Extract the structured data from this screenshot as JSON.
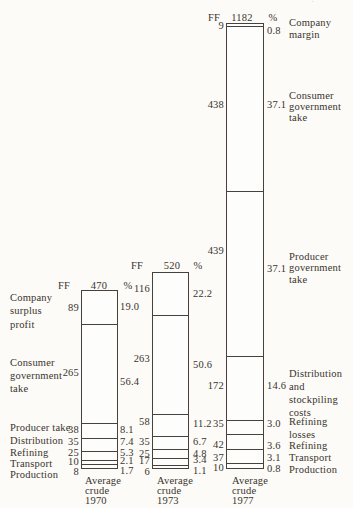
{
  "page": {
    "background": "#fcfbf8",
    "ink_color": "#3a342c",
    "line_color": "#46413a",
    "edge_artifact": "·˙"
  },
  "chart_data": {
    "type": "bar",
    "subtype": "stacked-cost-breakdown",
    "unit_left": "FF",
    "unit_right": "%",
    "baseline_y": 467,
    "px_per_ff": 0.3757,
    "bars": [
      {
        "year": "1970",
        "title_lines": [
          "Average",
          "crude",
          "1970"
        ],
        "title_x": 85,
        "title_y": 480,
        "total_ff": 470,
        "x": 81,
        "width": 37,
        "value_col_right": 79,
        "pct_col_left": 120,
        "header": {
          "ff_x": 64,
          "total_x": 99,
          "pct_x": 128,
          "y": 285
        },
        "segments": [
          {
            "name": "Company surplus profit",
            "ff": 89,
            "pct": "19.0",
            "value_y": 307,
            "pct_y": 306
          },
          {
            "name": "Consumer government take",
            "ff": 265,
            "pct": "56.4",
            "value_y": 372,
            "pct_y": 381
          },
          {
            "name": "Producer take",
            "ff": 38,
            "pct": "8.1",
            "value_y": 429,
            "pct_y": 429.5
          },
          {
            "name": "Distribution",
            "ff": 35,
            "pct": "7.4",
            "value_y": 441,
            "pct_y": 441.5
          },
          {
            "name": "Refining",
            "ff": 25,
            "pct": "5.3",
            "value_y": 452,
            "pct_y": 452
          },
          {
            "name": "Transport",
            "ff": 10,
            "pct": "2.1",
            "value_y": 461.5,
            "pct_y": 460.5
          },
          {
            "name": "Production",
            "ff": 8,
            "pct": "1.7",
            "value_y": 471.5,
            "pct_y": 470.5
          }
        ]
      },
      {
        "year": "1973",
        "title_lines": [
          "Average",
          "crude",
          "1973"
        ],
        "title_x": 157,
        "title_y": 480,
        "total_ff": 520,
        "x": 152,
        "width": 37,
        "value_col_right": 150,
        "pct_col_left": 193,
        "header": {
          "ff_x": 137,
          "total_x": 172,
          "pct_x": 198,
          "y": 265
        },
        "segments": [
          {
            "name": "Company surplus profit",
            "ff": 116,
            "pct": "22.2",
            "value_y": 288,
            "pct_y": 293
          },
          {
            "name": "Consumer government take",
            "ff": 263,
            "pct": "50.6",
            "value_y": 358,
            "pct_y": 364
          },
          {
            "name": "Producer take",
            "ff": 58,
            "pct": "11.2",
            "value_y": 421.5,
            "pct_y": 423
          },
          {
            "name": "Distribution",
            "ff": 35,
            "pct": "6.7",
            "value_y": 441.5,
            "pct_y": 441.5
          },
          {
            "name": "Refining",
            "ff": 25,
            "pct": "4.8",
            "value_y": 453,
            "pct_y": 453
          },
          {
            "name": "Transport",
            "ff": 17,
            "pct": "3.4",
            "value_y": 460.5,
            "pct_y": 459.5
          },
          {
            "name": "Production",
            "ff": 6,
            "pct": "1.1",
            "value_y": 471,
            "pct_y": 470
          }
        ]
      },
      {
        "year": "1977",
        "title_lines": [
          "Average",
          "crude",
          "1977"
        ],
        "title_x": 232,
        "title_y": 480,
        "total_ff": 1182,
        "x": 226,
        "width": 37.5,
        "value_col_right": 224,
        "pct_col_left": 267,
        "header": {
          "ff_x": 214,
          "total_x": 242,
          "pct_x": 273,
          "y": 17
        },
        "segments": [
          {
            "name": "Company margin",
            "ff": 9,
            "pct": "0.8",
            "value_y": 25.5,
            "pct_y": 30
          },
          {
            "name": "Consumer government take",
            "ff": 438,
            "pct": "37.1",
            "value_y": 104,
            "pct_y": 104.5
          },
          {
            "name": "Producer government take",
            "ff": 439,
            "pct": "37.1",
            "value_y": 250,
            "pct_y": 268
          },
          {
            "name": "Distribution and stockpiling costs",
            "ff": 172,
            "pct": "14.6",
            "value_y": 385.5,
            "pct_y": 385.5
          },
          {
            "name": "Refining losses",
            "ff": 35,
            "pct": "3.0",
            "value_y": 423,
            "pct_y": 423
          },
          {
            "name": "Refining",
            "ff": 42,
            "pct": "3.6",
            "value_y": 444.5,
            "pct_y": 445
          },
          {
            "name": "Transport",
            "ff": 37,
            "pct": "3.1",
            "value_y": 457,
            "pct_y": 457
          },
          {
            "name": "Production",
            "ff": 10,
            "pct": "0.8",
            "value_y": 467.5,
            "pct_y": 468.5
          }
        ]
      }
    ],
    "left_labels": [
      {
        "lines": [
          "Company",
          "surplus",
          "profit"
        ],
        "x": 10,
        "y": 297,
        "lh": 13.5
      },
      {
        "lines": [
          "Consumer",
          "government",
          "take"
        ],
        "x": 10,
        "y": 362,
        "lh": 13
      },
      {
        "lines": [
          "Producer take"
        ],
        "x": 10,
        "y": 427.5,
        "lh": 12
      },
      {
        "lines": [
          "Distribution"
        ],
        "x": 10,
        "y": 440,
        "lh": 12
      },
      {
        "lines": [
          "Refining"
        ],
        "x": 10,
        "y": 452,
        "lh": 12
      },
      {
        "lines": [
          "Transport"
        ],
        "x": 10,
        "y": 463,
        "lh": 12
      },
      {
        "lines": [
          "Production"
        ],
        "x": 10,
        "y": 474,
        "lh": 12
      }
    ],
    "right_labels": [
      {
        "lines": [
          "Company",
          "margin"
        ],
        "x": 289,
        "y": 22,
        "lh": 12
      },
      {
        "lines": [
          "Consumer",
          "government",
          "take"
        ],
        "x": 289,
        "y": 95,
        "lh": 11
      },
      {
        "lines": [
          "Producer",
          "government",
          "take"
        ],
        "x": 289,
        "y": 256,
        "lh": 11.5
      },
      {
        "lines": [
          "Distribution",
          "and",
          "stockpiling",
          "costs"
        ],
        "x": 289,
        "y": 373,
        "lh": 13
      },
      {
        "lines": [
          "Refining",
          "losses"
        ],
        "x": 289,
        "y": 421,
        "lh": 13
      },
      {
        "lines": [
          "Refining"
        ],
        "x": 289,
        "y": 445,
        "lh": 12
      },
      {
        "lines": [
          "Transport"
        ],
        "x": 289,
        "y": 457,
        "lh": 12
      },
      {
        "lines": [
          "Production"
        ],
        "x": 289,
        "y": 469,
        "lh": 12
      }
    ]
  }
}
